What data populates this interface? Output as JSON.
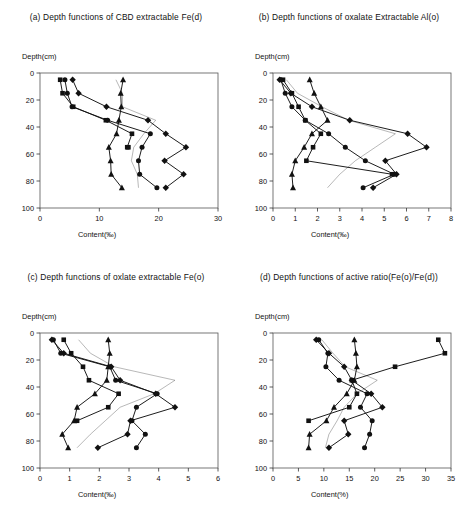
{
  "figure": {
    "background": "#ffffff",
    "line_color": "#111111",
    "marker_color": "#111111",
    "width": 465,
    "height": 519
  },
  "panels": [
    {
      "id": "a",
      "title": "(a)  Depth functions of CBD extractable Fe(d)",
      "y_axis_label": "Depth(cm)",
      "x_axis_label": "Content(‰)"
    },
    {
      "id": "b",
      "title": "(b)  Depth functions of oxalate Extractable Al(o)",
      "y_axis_label": "Depth(cm)",
      "x_axis_label": "Content(‰)"
    },
    {
      "id": "c",
      "title": "(c) Depth functions of oxlate extractable Fe(o)",
      "y_axis_label": "Depth(cm)",
      "x_axis_label": "Content(‰)"
    },
    {
      "id": "d",
      "title": "(d) Depth functions of active ratio(Fe(o)/Fe(d))",
      "y_axis_label": "Depth(cm)",
      "x_axis_label": "Content(%)"
    }
  ],
  "chart_data": [
    {
      "panel": "a",
      "type": "line",
      "title": "(a)  Depth functions of CBD extractable Fe(d)",
      "xlabel": "Content(‰)",
      "ylabel": "Depth(cm)",
      "xlim": [
        0,
        30
      ],
      "xticks": [
        0,
        10,
        20,
        30
      ],
      "ylim": [
        0,
        100
      ],
      "yticks": [
        0,
        20,
        40,
        60,
        80,
        100
      ],
      "y_inverted": true,
      "grid": false,
      "legend": "none",
      "depths": [
        5,
        15,
        25,
        35,
        45,
        55,
        65,
        75,
        85
      ],
      "series": [
        {
          "name": "profile-1",
          "marker": "square",
          "x": [
            3.4,
            3.8,
            5.6,
            11.1,
            15.5,
            14.7,
            14.9,
            null,
            null
          ],
          "y": [
            5,
            15,
            25,
            35,
            45,
            55,
            55,
            null,
            null
          ]
        },
        {
          "name": "profile-2",
          "marker": "circle",
          "x": [
            4.2,
            4.6,
            5.4,
            11.4,
            18.6,
            17.2,
            16.6,
            16.8,
            19.7
          ],
          "y": [
            5,
            15,
            25,
            35,
            45,
            55,
            65,
            75,
            85
          ]
        },
        {
          "name": "profile-3",
          "marker": "diamond",
          "x": [
            5.5,
            6.5,
            11.2,
            18.2,
            21.2,
            24.6,
            21.0,
            24.2,
            21.2
          ],
          "y": [
            5,
            15,
            25,
            35,
            45,
            55,
            65,
            75,
            85
          ]
        },
        {
          "name": "profile-4",
          "marker": "triangle",
          "x": [
            14.0,
            13.6,
            13.7,
            13.3,
            12.9,
            11.6,
            11.9,
            12.0,
            13.8
          ],
          "y": [
            5,
            15,
            25,
            35,
            45,
            55,
            65,
            75,
            85
          ]
        },
        {
          "name": "profile-5-thin",
          "marker": "none",
          "x": [
            12.8,
            13.9,
            13.9,
            19.5,
            17.5,
            15.8,
            15.4,
            16.4,
            16.6
          ],
          "y": [
            5,
            15,
            25,
            35,
            45,
            55,
            65,
            75,
            85
          ]
        }
      ]
    },
    {
      "panel": "b",
      "type": "line",
      "title": "(b)  Depth functions of oxalate Extractable Al(o)",
      "xlabel": "Content(‰)",
      "ylabel": "Depth(cm)",
      "xlim": [
        0,
        8
      ],
      "xticks": [
        0,
        1,
        2,
        3,
        4,
        5,
        6,
        7,
        8
      ],
      "ylim": [
        0,
        100
      ],
      "yticks": [
        0,
        20,
        40,
        60,
        80,
        100
      ],
      "y_inverted": true,
      "grid": false,
      "legend": "none",
      "depths": [
        5,
        15,
        25,
        35,
        45,
        55,
        65,
        75,
        85
      ],
      "series": [
        {
          "name": "profile-1",
          "marker": "square",
          "x": [
            0.45,
            0.85,
            1.15,
            1.45,
            2.15,
            1.8,
            1.5,
            5.35,
            null
          ],
          "y": [
            5,
            15,
            25,
            35,
            45,
            55,
            65,
            75,
            null
          ]
        },
        {
          "name": "profile-2",
          "marker": "circle",
          "x": [
            0.35,
            0.55,
            0.85,
            1.45,
            2.5,
            3.25,
            4.15,
            5.45,
            4.05
          ],
          "y": [
            5,
            15,
            25,
            35,
            45,
            55,
            65,
            75,
            85
          ]
        },
        {
          "name": "profile-3",
          "marker": "diamond",
          "x": [
            0.3,
            0.8,
            1.75,
            3.45,
            6.05,
            6.9,
            5.05,
            5.55,
            4.5
          ],
          "y": [
            5,
            15,
            25,
            35,
            45,
            55,
            65,
            75,
            85
          ]
        },
        {
          "name": "profile-4",
          "marker": "triangle",
          "x": [
            1.65,
            1.85,
            2.15,
            2.45,
            1.75,
            1.4,
            1.0,
            0.85,
            0.9
          ],
          "y": [
            5,
            15,
            25,
            35,
            45,
            55,
            65,
            75,
            85
          ]
        },
        {
          "name": "profile-5-thin",
          "marker": "none",
          "x": [
            0.6,
            1.1,
            2.2,
            3.4,
            5.5,
            4.6,
            3.7,
            3.0,
            2.45
          ],
          "y": [
            5,
            15,
            25,
            35,
            45,
            55,
            65,
            75,
            85
          ]
        }
      ]
    },
    {
      "panel": "c",
      "type": "line",
      "title": "(c) Depth functions of oxlate extractable Fe(o)",
      "xlabel": "Content(‰)",
      "ylabel": "Depth(cm)",
      "xlim": [
        0,
        6
      ],
      "xticks": [
        0,
        1,
        2,
        3,
        4,
        5,
        6
      ],
      "ylim": [
        0,
        100
      ],
      "yticks": [
        0,
        20,
        40,
        60,
        80,
        100
      ],
      "y_inverted": true,
      "grid": false,
      "legend": "none",
      "depths": [
        5,
        15,
        25,
        35,
        45,
        55,
        65,
        75,
        85
      ],
      "series": [
        {
          "name": "profile-1",
          "marker": "square",
          "x": [
            0.8,
            1.05,
            1.45,
            1.65,
            2.65,
            2.3,
            1.25,
            null,
            null
          ],
          "y": [
            5,
            15,
            25,
            35,
            45,
            55,
            65,
            null,
            null
          ]
        },
        {
          "name": "profile-2",
          "marker": "circle",
          "x": [
            0.45,
            0.7,
            2.35,
            2.55,
            3.95,
            3.25,
            3.1,
            3.55,
            3.25
          ],
          "y": [
            5,
            15,
            25,
            35,
            45,
            55,
            65,
            75,
            85
          ]
        },
        {
          "name": "profile-3",
          "marker": "diamond",
          "x": [
            0.4,
            0.8,
            2.4,
            2.7,
            3.9,
            4.55,
            3.05,
            2.95,
            1.95
          ],
          "y": [
            5,
            15,
            25,
            35,
            45,
            55,
            65,
            75,
            85
          ]
        },
        {
          "name": "profile-4",
          "marker": "triangle",
          "x": [
            2.3,
            2.35,
            2.3,
            2.25,
            1.85,
            1.25,
            1.15,
            0.75,
            0.95
          ],
          "y": [
            5,
            15,
            25,
            35,
            45,
            55,
            65,
            75,
            85
          ]
        },
        {
          "name": "profile-5-thin",
          "marker": "none",
          "x": [
            1.3,
            1.7,
            2.5,
            4.55,
            3.85,
            2.7,
            2.2,
            1.7,
            1.25
          ],
          "y": [
            5,
            15,
            25,
            35,
            45,
            55,
            65,
            75,
            85
          ]
        }
      ]
    },
    {
      "panel": "d",
      "type": "line",
      "title": "(d) Depth functions of active ratio(Fe(o)/Fe(d))",
      "xlabel": "Content(%)",
      "ylabel": "Depth(cm)",
      "xlim": [
        0,
        35
      ],
      "xticks": [
        0,
        5,
        10,
        15,
        20,
        25,
        30,
        35
      ],
      "ylim": [
        0,
        100
      ],
      "yticks": [
        0,
        20,
        40,
        60,
        80,
        100
      ],
      "y_inverted": true,
      "grid": false,
      "legend": "none",
      "depths": [
        5,
        15,
        25,
        35,
        45,
        55,
        65,
        75,
        85
      ],
      "series": [
        {
          "name": "profile-1",
          "marker": "square",
          "x": [
            32.5,
            33.8,
            24.0,
            15.5,
            16.5,
            15.0,
            7.0,
            null,
            null
          ],
          "y": [
            5,
            15,
            25,
            35,
            45,
            55,
            65,
            null,
            null
          ]
        },
        {
          "name": "profile-2",
          "marker": "circle",
          "x": [
            9.0,
            10.8,
            10.4,
            13.0,
            18.5,
            17.2,
            19.5,
            19.0,
            18.0
          ],
          "y": [
            5,
            15,
            25,
            35,
            45,
            55,
            65,
            75,
            85
          ]
        },
        {
          "name": "profile-3",
          "marker": "diamond",
          "x": [
            8.5,
            11.0,
            14.0,
            15.5,
            19.3,
            21.5,
            14.0,
            14.8,
            11.0
          ],
          "y": [
            5,
            15,
            25,
            35,
            45,
            55,
            65,
            75,
            85
          ]
        },
        {
          "name": "profile-4",
          "marker": "triangle",
          "x": [
            16.0,
            16.3,
            16.5,
            16.0,
            14.5,
            12.0,
            10.5,
            7.2,
            7.0
          ],
          "y": [
            5,
            15,
            25,
            35,
            45,
            55,
            65,
            75,
            85
          ]
        },
        {
          "name": "profile-5-thin",
          "marker": "none",
          "x": [
            9.6,
            11.8,
            14.2,
            20.5,
            16.5,
            14.0,
            12.6,
            11.0,
            10.3
          ],
          "y": [
            5,
            15,
            25,
            35,
            45,
            55,
            65,
            75,
            85
          ]
        }
      ]
    }
  ]
}
